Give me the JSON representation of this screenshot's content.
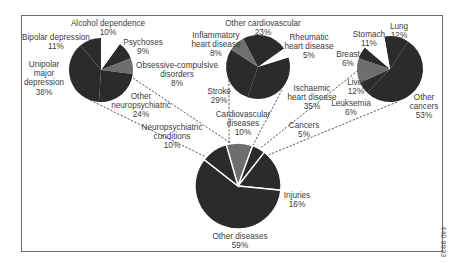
{
  "chart_data": {
    "type": "pie",
    "title": "",
    "layout": "exploded pie-of-pie (main pie with three breakdown pies linked by dashed lines)",
    "pies": [
      {
        "name": "All diseases",
        "role": "main",
        "slices": [
          {
            "label": "Other diseases",
            "value": 59
          },
          {
            "label": "Injuries",
            "value": 16
          },
          {
            "label": "Cancers",
            "value": 5
          },
          {
            "label": "Cardiovascular diseases",
            "value": 10
          },
          {
            "label": "Neuropsychiatric conditions",
            "value": 10
          }
        ]
      },
      {
        "name": "Neuropsychiatric conditions",
        "role": "breakdown",
        "slices": [
          {
            "label": "Unipolar major depression",
            "value": 38
          },
          {
            "label": "Bipolar depression",
            "value": 11
          },
          {
            "label": "Alcohol dependence",
            "value": 10
          },
          {
            "label": "Psychoses",
            "value": 9
          },
          {
            "label": "Obsessive-compulsive disorders",
            "value": 8
          },
          {
            "label": "Other neuropsychiatric",
            "value": 24
          }
        ]
      },
      {
        "name": "Cardiovascular diseases",
        "role": "breakdown",
        "slices": [
          {
            "label": "Other cardiovascular",
            "value": 23
          },
          {
            "label": "Rheumatic heart disease",
            "value": 5
          },
          {
            "label": "Ischaemic heart disease",
            "value": 35
          },
          {
            "label": "Stroke",
            "value": 29
          },
          {
            "label": "Inflammatory heart disease",
            "value": 8
          }
        ]
      },
      {
        "name": "Cancers",
        "role": "breakdown",
        "slices": [
          {
            "label": "Lung",
            "value": 12
          },
          {
            "label": "Other cancers",
            "value": 53
          },
          {
            "label": "Leuksemia",
            "value": 6
          },
          {
            "label": "Liver",
            "value": 12
          },
          {
            "label": "Breast",
            "value": 6
          },
          {
            "label": "Stomach",
            "value": 11
          }
        ]
      }
    ],
    "figure_number": "440 9933"
  },
  "labels": {
    "neuro": {
      "alcohol": [
        "Alcohol dependence",
        "10%"
      ],
      "bipolar": [
        "Bipolar depression",
        "11%"
      ],
      "psychoses": [
        "Psychoses",
        "9%"
      ],
      "unipolar": [
        "Unipolar",
        "major",
        "depression",
        "38%"
      ],
      "ocd": [
        "Obsessive-compulsive",
        "disorders",
        "8%"
      ],
      "other": [
        "Other",
        "neuropsychiatric",
        "24%"
      ]
    },
    "cardio": {
      "other": [
        "Other cardiovascular",
        "23%"
      ],
      "inflammatory": [
        "Inflammatory",
        "heart disease",
        "8%"
      ],
      "rheumatic": [
        "Rheumatic",
        "heart disease",
        "5%"
      ],
      "stroke": [
        "Stroke",
        "29%"
      ],
      "ischaemic": [
        "Ischaemic",
        "heart disease",
        "35%"
      ]
    },
    "cancer": {
      "lung": [
        "Lung",
        "12%"
      ],
      "stomach": [
        "Stomach",
        "11%"
      ],
      "breast": [
        "Breast",
        "6%"
      ],
      "liver": [
        "Liver",
        "12%"
      ],
      "leuksemia": [
        "Leuksemia",
        "6%"
      ],
      "other": [
        "Other",
        "cancers",
        "53%"
      ]
    },
    "main": {
      "neuro": [
        "Neuropsychiatric",
        "conditions",
        "10%"
      ],
      "cardio": [
        "Cardiovascular",
        "diseases",
        "10%"
      ],
      "cancers": [
        "Cancers",
        "5%"
      ],
      "injuries": [
        "Injuries",
        "16%"
      ],
      "other": [
        "Other diseases",
        "59%"
      ]
    }
  },
  "colors": {
    "dark": "#2b2b2b",
    "grey": "#6e6e6e",
    "gap": "#ffffff",
    "frame": "#6a6a6a",
    "text": "#3c3c3c"
  }
}
